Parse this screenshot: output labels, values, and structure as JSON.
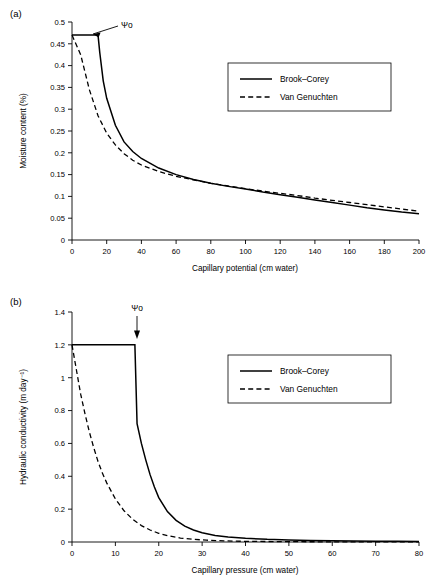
{
  "figure": {
    "panel_a_label": "(a)",
    "panel_b_label": "(b)"
  },
  "chart_data": [
    {
      "type": "line",
      "panel": "(a)",
      "title": "",
      "xlabel": "Capillary potential (cm water)",
      "ylabel": "Moisture content (%)",
      "xlim": [
        0,
        200
      ],
      "ylim": [
        0,
        0.5
      ],
      "xticks": [
        0,
        20,
        40,
        60,
        80,
        100,
        120,
        140,
        160,
        180,
        200
      ],
      "yticks": [
        "0",
        "0.05",
        "0.1",
        "0.15",
        "0.2",
        "0.25",
        "0.3",
        "0.35",
        "0.4",
        "0.45",
        "0.5"
      ],
      "grid": false,
      "legend_position": "upper-right",
      "annotations": [
        {
          "text": "Ψo",
          "x": 22,
          "y": 0.478,
          "note": "air-entry potential arrow pointing to kink in Brooke-Corey curve"
        }
      ],
      "series": [
        {
          "name": "Brook–Corey",
          "style": "solid",
          "x": [
            0,
            5,
            10,
            14,
            15,
            16,
            18,
            20,
            25,
            30,
            35,
            40,
            50,
            60,
            70,
            80,
            90,
            100,
            110,
            120,
            130,
            140,
            150,
            160,
            170,
            180,
            190,
            200
          ],
          "y": [
            0.47,
            0.47,
            0.47,
            0.47,
            0.47,
            0.43,
            0.365,
            0.325,
            0.263,
            0.225,
            0.203,
            0.187,
            0.165,
            0.15,
            0.139,
            0.13,
            0.123,
            0.117,
            0.11,
            0.104,
            0.098,
            0.092,
            0.086,
            0.08,
            0.074,
            0.069,
            0.064,
            0.06
          ]
        },
        {
          "name": "Van Genuchten",
          "style": "dashed",
          "x": [
            0,
            5,
            10,
            15,
            20,
            25,
            30,
            35,
            40,
            50,
            60,
            70,
            80,
            90,
            100,
            110,
            120,
            130,
            140,
            150,
            160,
            170,
            180,
            190,
            200
          ],
          "y": [
            0.47,
            0.425,
            0.345,
            0.285,
            0.245,
            0.218,
            0.198,
            0.183,
            0.172,
            0.157,
            0.146,
            0.138,
            0.13,
            0.124,
            0.118,
            0.112,
            0.107,
            0.102,
            0.096,
            0.091,
            0.086,
            0.081,
            0.076,
            0.071,
            0.066
          ]
        }
      ]
    },
    {
      "type": "line",
      "panel": "(b)",
      "title": "",
      "xlabel": "Capillary pressure (cm water)",
      "ylabel": "Hydraulic conductivity (m day⁻¹)",
      "xlim": [
        0,
        80
      ],
      "ylim": [
        0,
        1.4
      ],
      "xticks": [
        0,
        10,
        20,
        30,
        40,
        50,
        60,
        70,
        80
      ],
      "yticks": [
        "0",
        "0.2",
        "0.4",
        "0.6",
        "0.8",
        "1",
        "1.2",
        "1.4"
      ],
      "grid": false,
      "legend_position": "upper-right",
      "annotations": [
        {
          "text": "Ψo",
          "x": 15,
          "y": 1.33,
          "note": "vertical arrow pointing down to the Brooke-Corey plateau break"
        }
      ],
      "series": [
        {
          "name": "Brook–Corey",
          "style": "solid",
          "x": [
            0,
            5,
            10,
            14.5,
            15,
            16,
            17,
            18,
            19,
            20,
            22,
            24,
            26,
            28,
            30,
            33,
            36,
            40,
            45,
            50,
            55,
            60,
            65,
            70,
            75,
            80
          ],
          "y": [
            1.2,
            1.2,
            1.2,
            1.2,
            0.72,
            0.6,
            0.5,
            0.41,
            0.335,
            0.27,
            0.185,
            0.132,
            0.097,
            0.073,
            0.056,
            0.04,
            0.031,
            0.023,
            0.016,
            0.012,
            0.009,
            0.007,
            0.006,
            0.005,
            0.004,
            0.003
          ]
        },
        {
          "name": "Van Genuchten",
          "style": "dashed",
          "x": [
            0,
            1,
            2,
            3,
            4,
            5,
            6,
            7,
            8,
            10,
            12,
            14,
            16,
            18,
            20,
            22,
            25,
            28,
            31,
            35,
            40,
            45,
            50,
            60,
            70,
            80
          ],
          "y": [
            1.2,
            1.05,
            0.9,
            0.78,
            0.67,
            0.575,
            0.49,
            0.42,
            0.36,
            0.262,
            0.19,
            0.138,
            0.1,
            0.073,
            0.053,
            0.039,
            0.024,
            0.016,
            0.011,
            0.007,
            0.004,
            0.003,
            0.002,
            0.001,
            0.001,
            0.0005
          ]
        }
      ]
    }
  ]
}
